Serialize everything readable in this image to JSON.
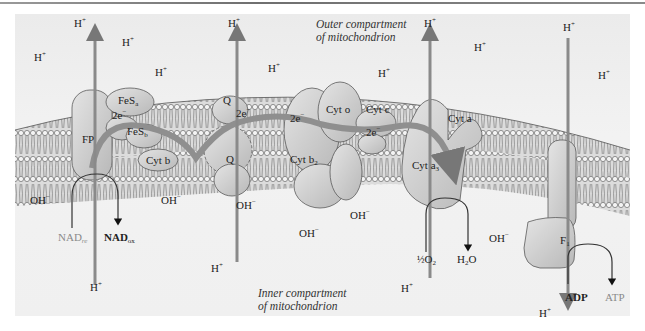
{
  "figure": {
    "compartments": {
      "outer": [
        "Outer compartment",
        "of mitochondrion"
      ],
      "inner": [
        "Inner compartment",
        "of mitochondrion"
      ]
    },
    "ions": {
      "proton": "H",
      "proton_charge": "+",
      "hydroxide": "OH",
      "hydroxide_charge": "−"
    },
    "complexes": {
      "fp": "FP",
      "fes_a": "FeS",
      "fes_a_sub": "a",
      "fes_b": "FeS",
      "fes_b_sub": "b",
      "cyt_b": "Cyt b",
      "q_top": "Q",
      "q_bottom": "Q",
      "cyt_b2": "Cyt b",
      "cyt_b2_sub": "2",
      "cyt_o": "Cyt o",
      "cyt_c": "Cyt c",
      "cyt_a": "Cyt a",
      "cyt_a3": "Cyt a",
      "cyt_a3_sub": "3",
      "f1": "F",
      "f1_sub": "1"
    },
    "electrons": {
      "label": "2e",
      "charge": "−"
    },
    "reactions": {
      "nad_red": "NAD",
      "nad_red_sub": "re",
      "nad_ox": "NAD",
      "nad_ox_sub": "ox",
      "half": "½",
      "o2": "O",
      "o2_sub": "2",
      "h2o_h": "H",
      "h2o_sub": "2",
      "h2o_o": "O",
      "adp": "ADP",
      "atp": "ATP"
    },
    "colors": {
      "background": "#f0f0f0",
      "membrane_fill": "#d9d9d9",
      "lipid_line": "#6a6a6a",
      "protein_fill": "#cfcfcf",
      "protein_stroke": "#5a5a5a",
      "electron_arrow": "#8a8a8a",
      "proton_channel": "#9a9a9a",
      "grey_text": "#8a8a8a"
    }
  }
}
